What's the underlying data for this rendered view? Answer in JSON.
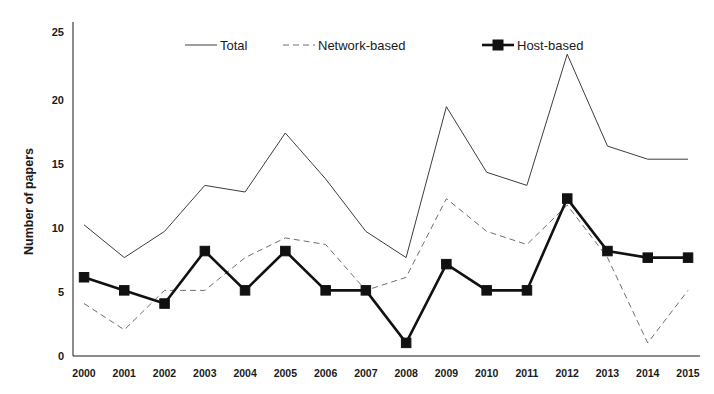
{
  "chart_data": {
    "type": "line",
    "title": "",
    "xlabel": "",
    "ylabel": "Number of papers",
    "categories": [
      "2000",
      "2001",
      "2002",
      "2003",
      "2004",
      "2005",
      "2006",
      "2007",
      "2008",
      "2009",
      "2010",
      "2011",
      "2012",
      "2013",
      "2014",
      "2015"
    ],
    "x": [
      2000,
      2001,
      2002,
      2003,
      2004,
      2005,
      2006,
      2007,
      2008,
      2009,
      2010,
      2011,
      2012,
      2013,
      2014,
      2015
    ],
    "series": [
      {
        "name": "Total",
        "style": "solid-thin",
        "color": "#3d3d3d",
        "values": [
          10,
          7.5,
          9.5,
          13,
          12.5,
          17,
          13.5,
          9.5,
          7.5,
          19,
          14,
          13,
          23,
          16,
          15,
          15
        ]
      },
      {
        "name": "Network-based",
        "style": "dashed",
        "color": "#6e6e6e",
        "values": [
          4,
          2,
          5,
          5,
          7.5,
          9,
          8.5,
          5,
          6,
          12,
          9.5,
          8.5,
          11.5,
          7.5,
          1,
          5
        ]
      },
      {
        "name": "Host-based",
        "style": "solid-thick-square-markers",
        "color": "#111111",
        "values": [
          6,
          5,
          4,
          8,
          5,
          8,
          5,
          5,
          1,
          7,
          5,
          5,
          12,
          8,
          7.5,
          7.5
        ]
      }
    ],
    "ylim": [
      0,
      25
    ],
    "yticks": [
      0,
      5,
      10,
      15,
      20,
      25
    ],
    "ytick_labels": [
      "0",
      "5",
      "10",
      "15",
      "20",
      "25"
    ],
    "grid": false,
    "legend_position": "top-center",
    "legend_entries": [
      "Total",
      "Network-based",
      "Host-based"
    ]
  }
}
